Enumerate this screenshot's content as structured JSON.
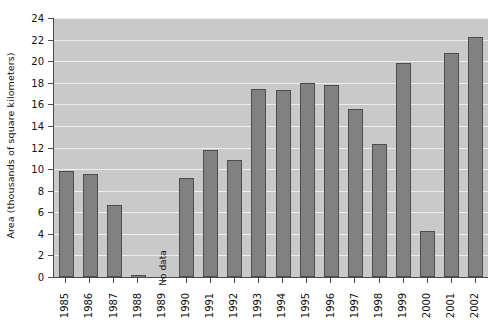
{
  "chart_data": {
    "type": "bar",
    "title": "",
    "xlabel": "",
    "ylabel": "Area (thousands of square kilometers)",
    "categories": [
      "1985",
      "1986",
      "1987",
      "1988",
      "1989",
      "1990",
      "1991",
      "1992",
      "1993",
      "1994",
      "1995",
      "1996",
      "1997",
      "1998",
      "1999",
      "2000",
      "2001",
      "2002"
    ],
    "values": [
      9.8,
      9.5,
      6.7,
      0.15,
      null,
      9.2,
      11.8,
      10.8,
      17.4,
      17.3,
      18.0,
      17.8,
      15.6,
      12.3,
      19.8,
      4.3,
      20.8,
      22.2
    ],
    "ylim": [
      0,
      24
    ],
    "ytick_labels": [
      "0",
      "2",
      "4",
      "6",
      "8",
      "10",
      "12",
      "14",
      "16",
      "18",
      "20",
      "22",
      "24"
    ],
    "ytick_values": [
      0,
      2,
      4,
      6,
      8,
      10,
      12,
      14,
      16,
      18,
      20,
      22,
      24
    ],
    "grid": true,
    "legend": null,
    "annotations": [
      {
        "category": "1989",
        "text": "No data"
      }
    ]
  },
  "colors": {
    "bar_fill": "#818181",
    "bar_border": "#4d4d4d",
    "plot_background": "#c9c9c9",
    "gridline": "#eeeeee",
    "axis": "#4a4a4a",
    "text": "#111111",
    "page_background": "#ffffff"
  }
}
